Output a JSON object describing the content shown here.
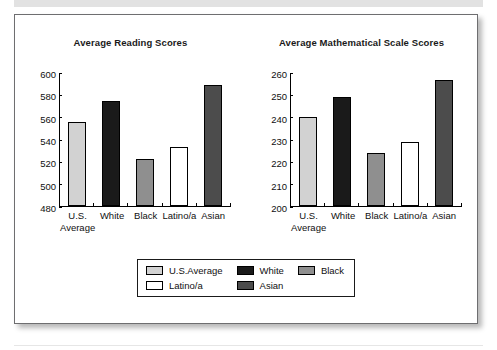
{
  "figure": {
    "background_color": "#ffffff",
    "border_color": "#6e6e70"
  },
  "chart_data": [
    {
      "type": "bar",
      "title": "Average Reading Scores",
      "categories": [
        "U.S.\nAverage",
        "White",
        "Black",
        "Latino/a",
        "Asian"
      ],
      "values": [
        556,
        575,
        522,
        533,
        589
      ],
      "colors": [
        "#d2d2d2",
        "#1a1a1a",
        "#8f8f8f",
        "#ffffff",
        "#4c4c4c"
      ],
      "xlabel": "",
      "ylabel": "",
      "ylim": [
        480,
        600
      ],
      "yticks": [
        600,
        580,
        560,
        540,
        520,
        500,
        480
      ],
      "grid": false
    },
    {
      "type": "bar",
      "title": "Average Mathematical\nScale Scores",
      "categories": [
        "U.S.\nAverage",
        "White",
        "Black",
        "Latino/a",
        "Asian"
      ],
      "values": [
        240,
        249,
        224,
        229,
        257
      ],
      "colors": [
        "#d2d2d2",
        "#1a1a1a",
        "#8f8f8f",
        "#ffffff",
        "#4c4c4c"
      ],
      "xlabel": "",
      "ylabel": "",
      "ylim": [
        200,
        260
      ],
      "yticks": [
        260,
        250,
        240,
        230,
        220,
        210,
        200
      ],
      "grid": false
    }
  ],
  "legend": {
    "position": "bottom-center",
    "entries": [
      {
        "label": "U.S.Average",
        "color": "#d2d2d2"
      },
      {
        "label": "White",
        "color": "#1a1a1a"
      },
      {
        "label": "Black",
        "color": "#8f8f8f"
      },
      {
        "label": "Latino/a",
        "color": "#ffffff"
      },
      {
        "label": "Asian",
        "color": "#4c4c4c"
      }
    ]
  }
}
